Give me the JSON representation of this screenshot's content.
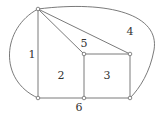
{
  "diagram": {
    "type": "planar graph with numbered faces",
    "vertices": [
      {
        "id": "A",
        "x": 38,
        "y": 9
      },
      {
        "id": "B",
        "x": 84,
        "y": 54
      },
      {
        "id": "C",
        "x": 130,
        "y": 54
      },
      {
        "id": "D",
        "x": 38,
        "y": 98
      },
      {
        "id": "E",
        "x": 84,
        "y": 98
      },
      {
        "id": "F",
        "x": 130,
        "y": 98
      }
    ],
    "faces": [
      {
        "label": "1",
        "x": 32,
        "y": 55
      },
      {
        "label": "2",
        "x": 61,
        "y": 76
      },
      {
        "label": "3",
        "x": 107,
        "y": 76
      },
      {
        "label": "4",
        "x": 130,
        "y": 32
      },
      {
        "label": "5",
        "x": 84,
        "y": 44
      },
      {
        "label": "6",
        "x": 79,
        "y": 108
      }
    ]
  }
}
